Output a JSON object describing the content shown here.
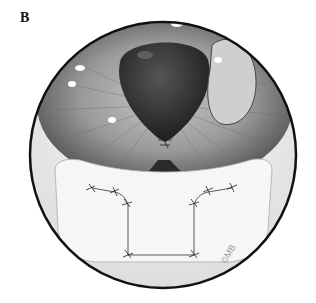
{
  "figure": {
    "panel_label": "B",
    "copyright_mark": "©MB"
  },
  "colors": {
    "outline": "#111111",
    "iris": "#8a8a8a",
    "pupil": "#2e2e2e",
    "sclera": "#eeeeee",
    "flap": "#f7f7f7",
    "suture": "#333333"
  }
}
